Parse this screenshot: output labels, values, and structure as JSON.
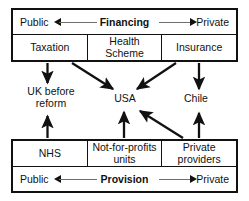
{
  "diagram": {
    "colors": {
      "stroke": "#111111",
      "background": "#ffffff",
      "thin_rule": "#6f6f6f"
    },
    "financing_band": {
      "axis_title": "Financing",
      "pole_left": "Public",
      "pole_right": "Private",
      "cells": [
        {
          "label": "Taxation"
        },
        {
          "label": "Health Scheme"
        },
        {
          "label": "Insurance"
        }
      ]
    },
    "provision_band": {
      "axis_title": "Provision",
      "pole_left": "Public",
      "pole_right": "Private",
      "cells": [
        {
          "label": "NHS"
        },
        {
          "label": "Not-for-profits units"
        },
        {
          "label": "Private providers"
        }
      ]
    },
    "countries": [
      {
        "id": "uk",
        "line1": "UK before",
        "line2": "reform"
      },
      {
        "id": "usa",
        "line1": "USA",
        "line2": ""
      },
      {
        "id": "chile",
        "line1": "Chile",
        "line2": ""
      }
    ],
    "connections": [
      {
        "from": "Taxation",
        "to": "UK before reform"
      },
      {
        "from": "Taxation",
        "to": "USA"
      },
      {
        "from": "Insurance",
        "to": "USA"
      },
      {
        "from": "Insurance",
        "to": "Chile"
      },
      {
        "from": "NHS",
        "to": "UK before reform"
      },
      {
        "from": "Not-for-profits units",
        "to": "USA"
      },
      {
        "from": "Private providers",
        "to": "USA"
      },
      {
        "from": "Private providers",
        "to": "Chile"
      }
    ]
  }
}
